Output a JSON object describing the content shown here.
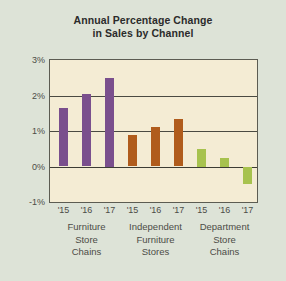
{
  "chart_data": {
    "type": "bar",
    "title": "Annual Percentage Change in Sales by Channel",
    "title_line1": "Annual Percentage Change",
    "title_line2": "in Sales by Channel",
    "xlabel": "",
    "ylabel": "",
    "ylim": [
      -1,
      3
    ],
    "yticks": [
      3,
      2,
      1,
      0,
      -1
    ],
    "ytick_labels": [
      "3%",
      "2%",
      "1%",
      "0%",
      "-1%"
    ],
    "grid": true,
    "legend_position": "none",
    "categories": [
      "'15",
      "'16",
      "'17",
      "'15",
      "'16",
      "'17",
      "'15",
      "'16",
      "'17"
    ],
    "values": [
      1.65,
      2.05,
      2.5,
      0.9,
      1.1,
      1.35,
      0.5,
      0.25,
      -0.5
    ],
    "groups": [
      {
        "name": "Furniture Store Chains",
        "label_lines": [
          "Furniture",
          "Store",
          "Chains"
        ],
        "color": "#7a4f8d",
        "points": [
          {
            "x": "'15",
            "y": 1.65
          },
          {
            "x": "'16",
            "y": 2.05
          },
          {
            "x": "'17",
            "y": 2.5
          }
        ]
      },
      {
        "name": "Independent Furniture Stores",
        "label_lines": [
          "Independent",
          "Furniture",
          "Stores"
        ],
        "color": "#b05c1c",
        "points": [
          {
            "x": "'15",
            "y": 0.9
          },
          {
            "x": "'16",
            "y": 1.1
          },
          {
            "x": "'17",
            "y": 1.35
          }
        ]
      },
      {
        "name": "Department Store Chains",
        "label_lines": [
          "Department",
          "Store",
          "Chains"
        ],
        "color": "#a7c24e",
        "points": [
          {
            "x": "'15",
            "y": 0.5
          },
          {
            "x": "'16",
            "y": 0.25
          },
          {
            "x": "'17",
            "y": -0.5
          }
        ]
      }
    ],
    "colors": {
      "series_1": "#7a4f8d",
      "series_2": "#b05c1c",
      "series_3": "#a7c24e",
      "plot_background": "#f4ecd4",
      "figure_background": "#dde3d7",
      "axis": "#4a4a42",
      "text": "#4c4c46"
    }
  },
  "yticks": [
    {
      "label": "3%",
      "value": 3
    },
    {
      "label": "2%",
      "value": 2
    },
    {
      "label": "1%",
      "value": 1
    },
    {
      "label": "0%",
      "value": 0
    },
    {
      "label": "-1%",
      "value": -1
    }
  ],
  "xticks": [
    {
      "label": "'15"
    },
    {
      "label": "'16"
    },
    {
      "label": "'17"
    },
    {
      "label": "'15"
    },
    {
      "label": "'16"
    },
    {
      "label": "'17"
    },
    {
      "label": "'15"
    },
    {
      "label": "'16"
    },
    {
      "label": "'17"
    }
  ],
  "group_labels": [
    {
      "l1": "Furniture",
      "l2": "Store",
      "l3": "Chains"
    },
    {
      "l1": "Independent",
      "l2": "Furniture",
      "l3": "Stores"
    },
    {
      "l1": "Department",
      "l2": "Store",
      "l3": "Chains"
    }
  ]
}
